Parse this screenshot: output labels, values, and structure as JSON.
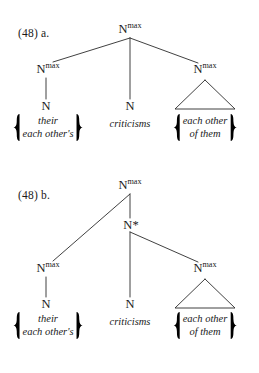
{
  "document": {
    "type": "linguistics-syntax-trees",
    "example_number": "(48)",
    "text_color": "#1a1a1a",
    "line_color": "#2b2b2b",
    "background": "#ffffff"
  },
  "trees": [
    {
      "id": "a",
      "label": "(48) a.",
      "root": {
        "name": "root-nmax",
        "base": "N",
        "superscript": "max",
        "x": 130,
        "y": 33
      },
      "nodes": [
        {
          "name": "left-nmax",
          "base": "N",
          "superscript": "max",
          "x": 48,
          "y": 73
        },
        {
          "name": "left-n",
          "base": "N",
          "superscript": "",
          "x": 48,
          "y": 108
        },
        {
          "name": "middle-n",
          "base": "N",
          "superscript": "",
          "x": 130,
          "y": 108
        },
        {
          "name": "right-nmax",
          "base": "N",
          "superscript": "max",
          "x": 205,
          "y": 73
        }
      ],
      "terminals": [
        {
          "name": "left-terminal-set",
          "lines": [
            "their",
            "each other's"
          ],
          "braced": true,
          "x": 48,
          "y": 120
        },
        {
          "name": "middle-terminal",
          "lines": [
            "criticisms"
          ],
          "braced": false,
          "x": 130,
          "y": 122
        },
        {
          "name": "right-terminal-set",
          "lines": [
            "each other",
            "of them"
          ],
          "braced": true,
          "x": 205,
          "y": 120
        }
      ],
      "triangle": {
        "name": "right-triangle",
        "apex_x": 205,
        "apex_y": 79,
        "base_y": 109,
        "half_width": 30
      }
    },
    {
      "id": "b",
      "label": "(48) b.",
      "root": {
        "name": "root-nmax",
        "base": "N",
        "superscript": "max",
        "x": 130,
        "y": 188
      },
      "nodes": [
        {
          "name": "n-star",
          "base": "N",
          "superscript": "",
          "star": "*",
          "x": 130,
          "y": 226
        },
        {
          "name": "left-nmax",
          "base": "N",
          "superscript": "max",
          "x": 48,
          "y": 269
        },
        {
          "name": "left-n",
          "base": "N",
          "superscript": "",
          "x": 48,
          "y": 305
        },
        {
          "name": "middle-n",
          "base": "N",
          "superscript": "",
          "x": 130,
          "y": 305
        },
        {
          "name": "right-nmax",
          "base": "N",
          "superscript": "max",
          "x": 205,
          "y": 270
        }
      ],
      "terminals": [
        {
          "name": "left-terminal-set",
          "lines": [
            "their",
            "each other's"
          ],
          "braced": true,
          "x": 48,
          "y": 317
        },
        {
          "name": "middle-terminal",
          "lines": [
            "criticisms"
          ],
          "braced": false,
          "x": 130,
          "y": 319
        },
        {
          "name": "right-terminal-set",
          "lines": [
            "each other",
            "of them"
          ],
          "braced": true,
          "x": 205,
          "y": 317
        }
      ],
      "triangle": {
        "name": "right-triangle",
        "apex_x": 205,
        "apex_y": 276,
        "base_y": 306,
        "half_width": 30
      }
    }
  ],
  "glyphs": {
    "left-brace": "{",
    "right-brace": "}",
    "kleene-star": "*"
  }
}
